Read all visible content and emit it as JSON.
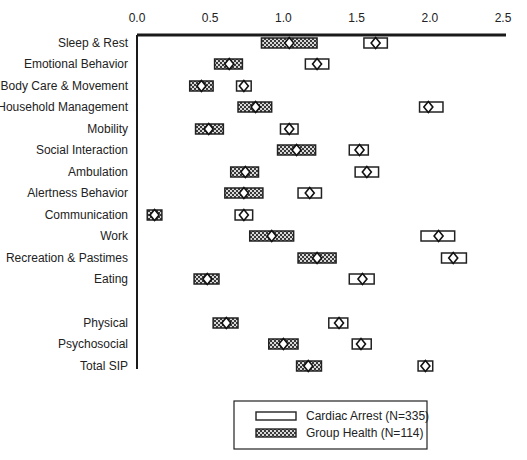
{
  "chart_data": {
    "type": "box-interval",
    "title": "",
    "xlabel": "",
    "ylabel": "",
    "xlim": [
      0.0,
      2.5
    ],
    "x_ticks": [
      "0.0",
      "0.5",
      "1.0",
      "1.5",
      "2.0",
      "2.5"
    ],
    "x_tick_values": [
      0.0,
      0.5,
      1.0,
      1.5,
      2.0,
      2.5
    ],
    "grid": false,
    "legend_position": "bottom-right",
    "categories": [
      "Sleep & Rest",
      "Emotional Behavior",
      "Body Care & Movement",
      "Household Management",
      "Mobility",
      "Social Interaction",
      "Ambulation",
      "Alertness Behavior",
      "Communication",
      "Work",
      "Recreation & Pastimes",
      "Eating",
      "Physical",
      "Psychosocial",
      "Total SIP"
    ],
    "series": [
      {
        "name": "Cardiac Arrest (N=335)",
        "style": "open",
        "mean": [
          1.63,
          1.23,
          0.73,
          1.99,
          1.04,
          1.52,
          1.57,
          1.18,
          0.73,
          2.06,
          2.16,
          1.54,
          1.38,
          1.53,
          1.97
        ],
        "low": [
          1.55,
          1.15,
          0.68,
          1.93,
          0.98,
          1.45,
          1.49,
          1.1,
          0.67,
          1.94,
          2.08,
          1.45,
          1.31,
          1.47,
          1.92
        ],
        "high": [
          1.71,
          1.31,
          0.78,
          2.09,
          1.1,
          1.58,
          1.65,
          1.26,
          0.79,
          2.17,
          2.25,
          1.62,
          1.44,
          1.6,
          2.02
        ]
      },
      {
        "name": "Group Health (N=114)",
        "style": "hatched",
        "mean": [
          1.04,
          0.63,
          0.44,
          0.81,
          0.49,
          1.09,
          0.74,
          0.73,
          0.12,
          0.92,
          1.23,
          0.48,
          0.61,
          1.0,
          1.17
        ],
        "low": [
          0.85,
          0.53,
          0.36,
          0.69,
          0.4,
          0.96,
          0.64,
          0.6,
          0.07,
          0.77,
          1.1,
          0.39,
          0.52,
          0.9,
          1.09
        ],
        "high": [
          1.23,
          0.72,
          0.52,
          0.92,
          0.59,
          1.22,
          0.83,
          0.86,
          0.17,
          1.07,
          1.36,
          0.56,
          0.69,
          1.1,
          1.26
        ]
      }
    ]
  },
  "legend": {
    "items": [
      {
        "label": "Cardiac Arrest (N=335)",
        "swatch": "open"
      },
      {
        "label": "Group Health (N=114)",
        "swatch": "hatched"
      }
    ]
  },
  "colors": {
    "axis": "#1a1a1a",
    "box_stroke": "#222222",
    "hatch_dark": "#3a3a3a",
    "hatch_light": "#d8d8d8",
    "open_fill": "#ffffff"
  }
}
